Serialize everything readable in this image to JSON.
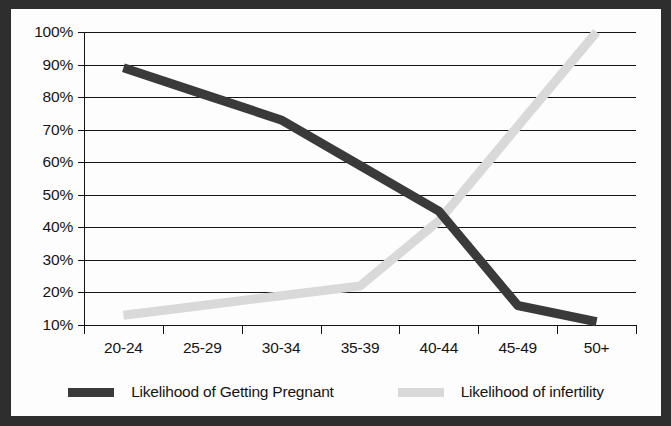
{
  "chart_data": {
    "type": "line",
    "title": "",
    "xlabel": "",
    "ylabel": "",
    "categories": [
      "20-24",
      "25-29",
      "30-34",
      "35-39",
      "40-44",
      "45-49",
      "50+"
    ],
    "ylim": [
      10,
      100
    ],
    "yticks": [
      10,
      20,
      30,
      40,
      50,
      60,
      70,
      80,
      90,
      100
    ],
    "ytick_labels": [
      "10%",
      "20%",
      "30%",
      "40%",
      "50%",
      "60%",
      "70%",
      "80%",
      "90%",
      "100%"
    ],
    "grid": true,
    "legend_position": "bottom",
    "series": [
      {
        "name": "Likelihood of Getting Pregnant",
        "color": "#3a3a3a",
        "values": [
          89,
          81,
          73,
          59,
          45,
          16,
          11
        ]
      },
      {
        "name": "Likelihood of infertility",
        "color": "#d9d9d9",
        "values": [
          13,
          16,
          19,
          22,
          42,
          71,
          100
        ]
      }
    ]
  },
  "legend": {
    "items": [
      {
        "label": "Likelihood of Getting Pregnant",
        "swatch": "legend-swatch-dark"
      },
      {
        "label": "Likelihood of infertility",
        "swatch": "legend-swatch-light"
      }
    ]
  },
  "frame": {
    "border_color": "#2e2e2e",
    "background_color": "#fdfdfd"
  }
}
